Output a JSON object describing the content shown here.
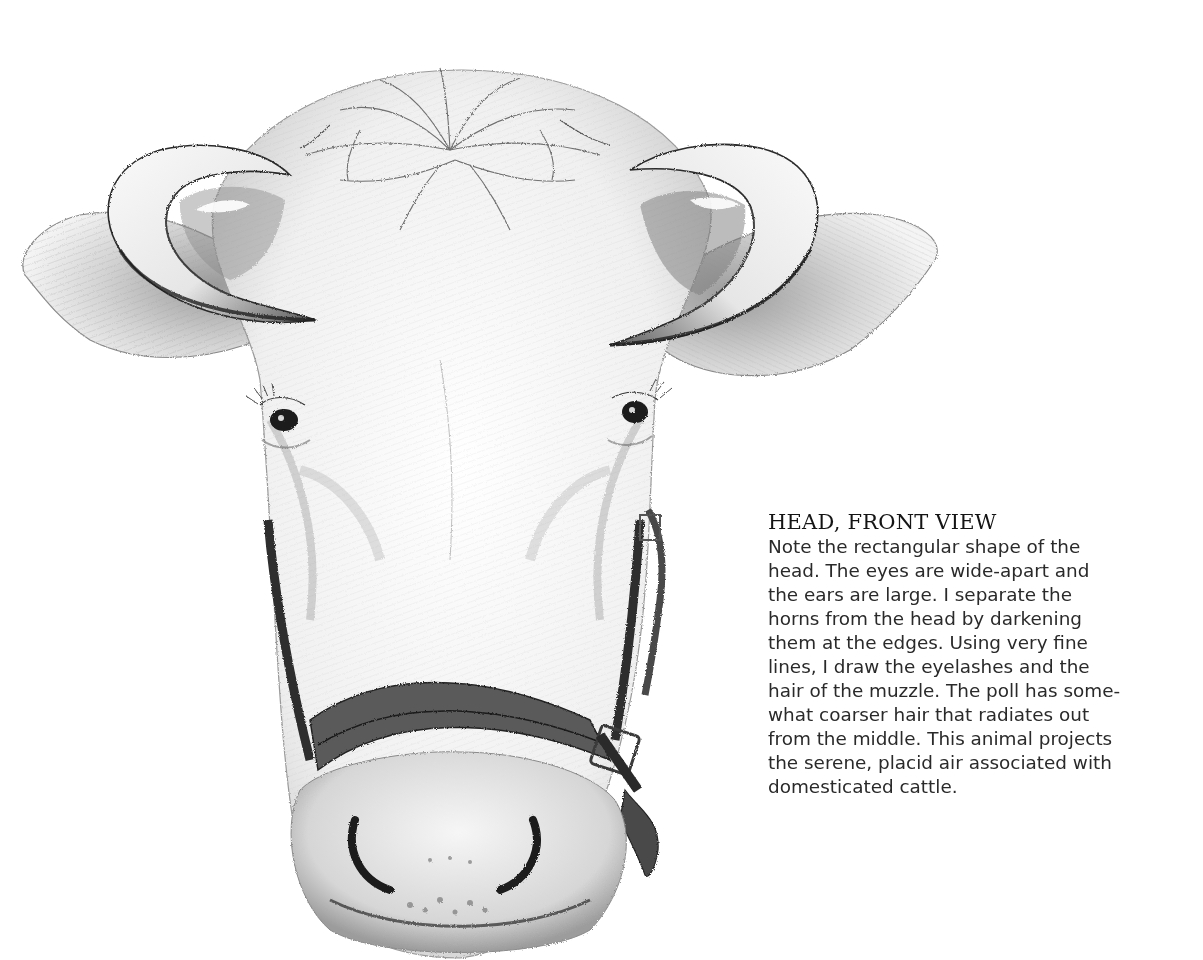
{
  "illustration": {
    "subject": "Cow head, front view — pencil drawing",
    "features": [
      "left-horn",
      "right-horn",
      "left-ear",
      "right-ear",
      "poll",
      "left-eye",
      "right-eye",
      "halter",
      "halter-buckle",
      "muzzle",
      "nostrils"
    ],
    "colors": {
      "paper": "#ffffff",
      "pencil_dark": "#2a2a2a",
      "pencil_mid": "#6e6e6e",
      "pencil_light": "#b4b4b4",
      "shade": "#d8d8d8"
    }
  },
  "caption": {
    "title": "HEAD, FRONT VIEW",
    "lines": [
      "Note the rectangular shape of the",
      "head. The eyes are wide-apart and",
      "the ears are large. I separate the",
      "horns from the head by darkening",
      "them at the edges. Using very fine",
      "lines, I draw the eyelashes and the",
      "hair of the muzzle. The poll has some-",
      "what coarser hair that radiates out",
      "from the middle. This animal projects",
      "the serene, placid air associated with",
      "domesticated cattle."
    ]
  }
}
